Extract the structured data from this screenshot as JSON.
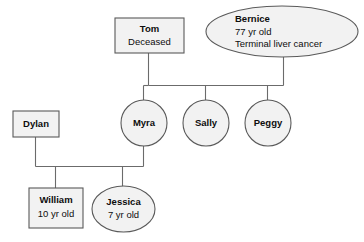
{
  "diagram": {
    "type": "genogram",
    "background_color": "#ffffff",
    "node_fill_color": "#f2f2f2",
    "node_border_color": "#5a5a5a",
    "connector_color": "#6b6b6b",
    "text_color": "#0d0d0d"
  },
  "nodes": {
    "tom": {
      "name": "Tom",
      "detail": "Deceased",
      "shape": "rectangle",
      "generation": 1,
      "gender_symbol": "male-square"
    },
    "bernice": {
      "name": "Bernice",
      "detail_age": "77 yr old",
      "detail_condition": "Terminal liver cancer",
      "shape": "ellipse",
      "generation": 1,
      "gender_symbol": "female-circle"
    },
    "dylan": {
      "name": "Dylan",
      "shape": "rectangle",
      "generation": 2,
      "gender_symbol": "male-square"
    },
    "myra": {
      "name": "Myra",
      "shape": "circle",
      "generation": 2,
      "gender_symbol": "female-circle"
    },
    "sally": {
      "name": "Sally",
      "shape": "circle",
      "generation": 2,
      "gender_symbol": "female-circle"
    },
    "peggy": {
      "name": "Peggy",
      "shape": "circle",
      "generation": 2,
      "gender_symbol": "female-circle"
    },
    "william": {
      "name": "William",
      "detail": "10 yr old",
      "shape": "rectangle",
      "generation": 3,
      "gender_symbol": "male-square"
    },
    "jessica": {
      "name": "Jessica",
      "detail": "7 yr old",
      "shape": "ellipse",
      "generation": 3,
      "gender_symbol": "female-circle"
    }
  },
  "relationships": [
    {
      "partner_a": "tom",
      "partner_b": "bernice",
      "children": [
        "myra",
        "sally",
        "peggy"
      ]
    },
    {
      "partner_a": "dylan",
      "partner_b": "myra",
      "children": [
        "william",
        "jessica"
      ]
    }
  ]
}
